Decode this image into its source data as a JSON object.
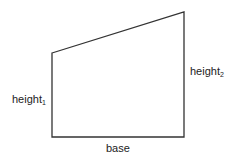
{
  "diagram": {
    "shape": "trapezoid",
    "stroke_color": "#333333",
    "vertices": {
      "top_left": [
        52,
        53
      ],
      "top_right": [
        184,
        12
      ],
      "bottom_right": [
        184,
        137
      ],
      "bottom_left": [
        52,
        137
      ]
    },
    "labels": {
      "left_side": {
        "text": "height",
        "subscript": "1"
      },
      "right_side": {
        "text": "height",
        "subscript": "2"
      },
      "bottom": {
        "text": "base"
      }
    }
  }
}
